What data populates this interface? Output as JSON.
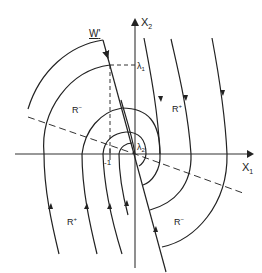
{
  "diagram": {
    "type": "phase-plane",
    "axes": {
      "x_label": "X",
      "x_sub": "1",
      "y_label": "X",
      "y_sub": "2",
      "tick_label": "-1"
    },
    "switching_line": {
      "label": "W",
      "prime": "'"
    },
    "points": [
      {
        "name": "λ",
        "sub": "1"
      },
      {
        "name": "λ",
        "sub": "2"
      }
    ],
    "regions": [
      {
        "label": "R",
        "sign": "−",
        "position": "upper-left"
      },
      {
        "label": "R",
        "sign": "+",
        "position": "upper-right"
      },
      {
        "label": "R",
        "sign": "+",
        "position": "lower-left"
      },
      {
        "label": "R",
        "sign": "−",
        "position": "lower-right"
      }
    ],
    "colors": {
      "line": "#222222",
      "background": "#ffffff"
    }
  }
}
